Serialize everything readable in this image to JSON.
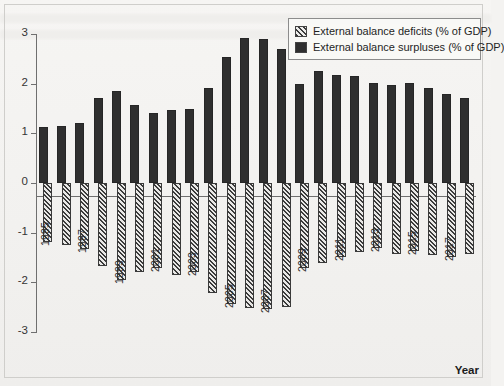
{
  "chart_data": {
    "type": "bar",
    "title": "",
    "xlabel": "Year",
    "ylabel": "",
    "ylim": [
      -3,
      3
    ],
    "yticks": [
      3,
      2,
      1,
      0,
      -1,
      -2,
      -3
    ],
    "ytick_labels": [
      "3",
      "2",
      "1",
      "0",
      "-1",
      "-2",
      "-3"
    ],
    "grid": false,
    "legend_position": "top-right",
    "categories": [
      "1995",
      "1996",
      "1997",
      "1998",
      "1999",
      "2000",
      "2001",
      "2002",
      "2003",
      "2004",
      "2005",
      "2006",
      "2007",
      "2008",
      "2009",
      "2010",
      "2011",
      "2012",
      "2013",
      "2014",
      "2015",
      "2016",
      "2017",
      "2018"
    ],
    "tick_label_years": [
      "1995",
      "1997",
      "1999",
      "2001",
      "2003",
      "2005",
      "2007",
      "2009",
      "2011",
      "2013",
      "2015",
      "2017"
    ],
    "series": [
      {
        "name": "External balance surpluses (% of GDP)",
        "color": "#2f2f2f",
        "pattern": "solid",
        "values": [
          1.12,
          1.15,
          1.2,
          1.71,
          1.86,
          1.57,
          1.4,
          1.47,
          1.49,
          1.92,
          2.54,
          2.92,
          2.9,
          2.7,
          1.99,
          2.25,
          2.18,
          2.15,
          2.02,
          1.97,
          2.01,
          1.92,
          1.79,
          1.72
        ]
      },
      {
        "name": "External balance deficits (% of GDP)",
        "color": "#3b3b3b",
        "pattern": "diagonal-hatch",
        "values": [
          -1.18,
          -1.25,
          -1.33,
          -1.68,
          -1.95,
          -1.8,
          -1.72,
          -1.86,
          -1.8,
          -2.22,
          -2.44,
          -2.52,
          -2.53,
          -2.5,
          -1.72,
          -1.62,
          -1.48,
          -1.38,
          -1.3,
          -1.43,
          -1.37,
          -1.45,
          -1.49,
          -1.43
        ]
      }
    ]
  },
  "legend": {
    "items": [
      {
        "label": "External balance deficits (% of GDP)",
        "swatch": "hatch"
      },
      {
        "label": "External balance surpluses (% of GDP)",
        "swatch": "solid"
      }
    ]
  },
  "axis": {
    "x_title": "Year"
  }
}
